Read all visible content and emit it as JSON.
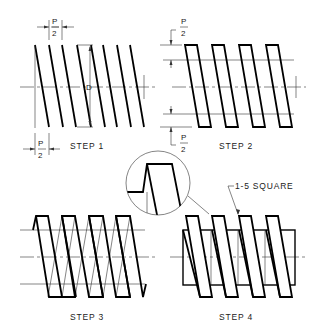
{
  "colors": {
    "line": "#000000",
    "thin": "#333333",
    "background": "#ffffff"
  },
  "steps": [
    {
      "label": "STEP 1",
      "annotations": {
        "pitch_half_top": {
          "num": "P",
          "den": "2"
        },
        "pitch_half_bottom": {
          "num": "P",
          "den": "2"
        },
        "diameter": "D"
      }
    },
    {
      "label": "STEP 2",
      "annotations": {
        "depth_top": {
          "num": "P",
          "den": "2"
        },
        "depth_bottom": {
          "num": "P",
          "den": "2"
        }
      }
    },
    {
      "label": "STEP 3"
    },
    {
      "label": "STEP 4",
      "callout": "1-5 SQUARE"
    }
  ],
  "detail": {
    "name": "enlarged-thread-detail"
  }
}
